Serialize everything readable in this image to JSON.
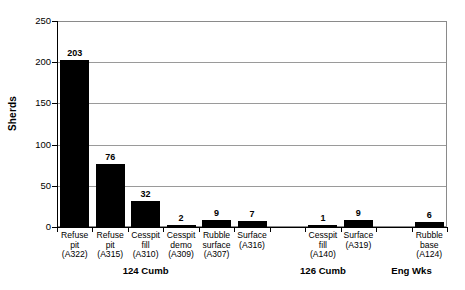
{
  "chart_data": {
    "type": "bar",
    "title": "",
    "xlabel": "",
    "ylabel": "Sherds",
    "ylim": [
      0,
      250
    ],
    "yticks": [
      0,
      50,
      100,
      150,
      200,
      250
    ],
    "ytick_labels": [
      "0",
      "50",
      "100",
      "150",
      "200",
      "250"
    ],
    "grid": true,
    "grid_axis": "y",
    "legend": "none",
    "bar_color": "#000000",
    "categories": [
      "Refuse pit (A322)",
      "Refuse pit (A315)",
      "Cesspit fill (A310)",
      "Cesspit demo (A309)",
      "Rubble surface (A307)",
      "Surface (A316)",
      "Cesspit fill (A140)",
      "Surface (A319)",
      "Rubble base (A124)"
    ],
    "values": [
      203,
      76,
      32,
      2,
      9,
      7,
      1,
      9,
      6
    ],
    "value_labels": [
      "203",
      "76",
      "32",
      "2",
      "9",
      "7",
      "1",
      "9",
      "6"
    ],
    "bars": [
      {
        "line1": "Refuse",
        "line2": "pit",
        "line3": "(A322)",
        "value": 203,
        "label": "203",
        "slot": 0,
        "group": "124 Cumb"
      },
      {
        "line1": "Refuse",
        "line2": "pit",
        "line3": "(A315)",
        "value": 76,
        "label": "76",
        "slot": 1,
        "group": "124 Cumb"
      },
      {
        "line1": "Cesspit",
        "line2": "fill",
        "line3": "(A310)",
        "value": 32,
        "label": "32",
        "slot": 2,
        "group": "124 Cumb"
      },
      {
        "line1": "Cesspit",
        "line2": "demo",
        "line3": "(A309)",
        "value": 2,
        "label": "2",
        "slot": 3,
        "group": "124 Cumb"
      },
      {
        "line1": "Rubble",
        "line2": "surface",
        "line3": "(A307)",
        "value": 9,
        "label": "9",
        "slot": 4,
        "group": "124 Cumb"
      },
      {
        "line1": "Surface",
        "line2": "",
        "line3": "(A316)",
        "value": 7,
        "label": "7",
        "slot": 5,
        "group": "124 Cumb"
      },
      {
        "line1": "Cesspit",
        "line2": "fill",
        "line3": "(A140)",
        "value": 1,
        "label": "1",
        "slot": 7,
        "group": "126 Cumb"
      },
      {
        "line1": "Surface",
        "line2": "",
        "line3": "(A319)",
        "value": 9,
        "label": "9",
        "slot": 8,
        "group": "126 Cumb"
      },
      {
        "line1": "Rubble",
        "line2": "base",
        "line3": "(A124)",
        "value": 6,
        "label": "6",
        "slot": 10,
        "group": "Eng Wks"
      }
    ],
    "groups": [
      {
        "label": "124 Cumb",
        "slot_center": 2.5
      },
      {
        "label": "126 Cumb",
        "slot_center": 7.5
      },
      {
        "label": "Eng Wks",
        "slot_center": 10.0
      }
    ]
  }
}
